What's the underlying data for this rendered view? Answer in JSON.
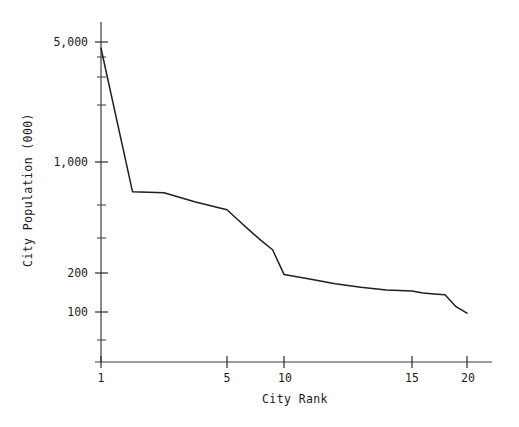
{
  "chart_data": {
    "type": "line",
    "title": "",
    "xlabel": "City Rank",
    "ylabel": "City Population (000)",
    "yscale": "log",
    "xscale": "linear",
    "grid": false,
    "legend": null,
    "xlim": [
      1,
      21
    ],
    "ylim": [
      85,
      6000
    ],
    "x_ticks": [
      1,
      5,
      10,
      15,
      20
    ],
    "x_tick_labels": [
      "1",
      "5",
      "10",
      "15",
      "20"
    ],
    "y_ticks": [
      100,
      200,
      1000,
      5000
    ],
    "y_tick_labels": [
      "100",
      "200",
      "1,000",
      "5,000"
    ],
    "y_minor_ticks": [
      300,
      500,
      700,
      2000,
      3000,
      4000
    ],
    "x": [
      1,
      2,
      3,
      4,
      5,
      6,
      7,
      8,
      9,
      10,
      11,
      12,
      13,
      14,
      15,
      16,
      17,
      18,
      19,
      20
    ],
    "values": [
      4600,
      650,
      640,
      560,
      500,
      430,
      370,
      320,
      280,
      195,
      180,
      165,
      155,
      148,
      145,
      140,
      138,
      136,
      110,
      98
    ],
    "series": [
      {
        "name": "City Population",
        "units": "thousands",
        "values": [
          4600,
          650,
          640,
          560,
          500,
          430,
          370,
          320,
          280,
          195,
          180,
          165,
          155,
          148,
          145,
          140,
          138,
          136,
          110,
          98
        ]
      }
    ],
    "annotations": []
  },
  "axes": {
    "x_title": "City Rank",
    "y_title": "City Population (000)"
  },
  "colors": {
    "line": "#1f1f1f",
    "axis": "#3c3c3c",
    "background": "#ffffff",
    "text": "#1a1a1a"
  }
}
